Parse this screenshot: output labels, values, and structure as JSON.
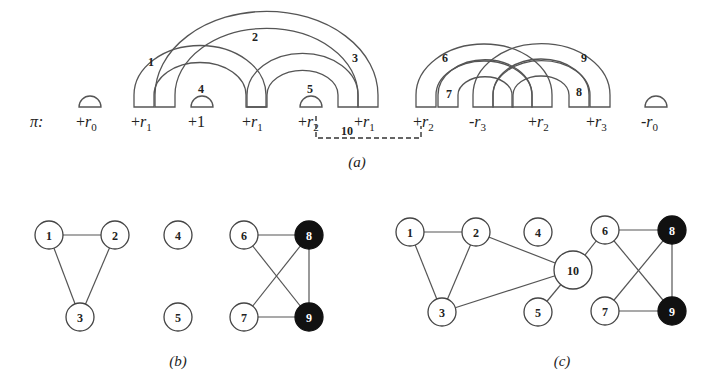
{
  "panel_a": {
    "pi_label": "π:",
    "caption": "(a)",
    "elements": [
      {
        "sign": "+",
        "sym": "r",
        "sub": "0",
        "x": 90
      },
      {
        "sign": "+",
        "sym": "r",
        "sub": "1",
        "x": 145
      },
      {
        "sign": "+",
        "sym": "1",
        "sub": "",
        "x": 202
      },
      {
        "sign": "+",
        "sym": "r",
        "sub": "1",
        "x": 256
      },
      {
        "sign": "+",
        "sym": "r",
        "sub": "2",
        "x": 312
      },
      {
        "sign": "+",
        "sym": "r",
        "sub": "1",
        "x": 368
      },
      {
        "sign": "+",
        "sym": "r",
        "sub": "2",
        "x": 427
      },
      {
        "sign": "-",
        "sym": "r",
        "sub": "3",
        "x": 483
      },
      {
        "sign": "+",
        "sym": "r",
        "sub": "2",
        "x": 542
      },
      {
        "sign": "+",
        "sym": "r",
        "sub": "3",
        "x": 600
      },
      {
        "sign": "-",
        "sym": "r",
        "sub": "0",
        "x": 655
      }
    ],
    "arcs": [
      {
        "label": "1",
        "x1": 134,
        "x2": 266,
        "lx": 148,
        "ly": 66
      },
      {
        "label": "2",
        "x1": 155,
        "x2": 378,
        "lx": 252,
        "ly": 41
      },
      {
        "label": "3",
        "x1": 247,
        "x2": 358,
        "lx": 352,
        "ly": 62
      },
      {
        "label": "6",
        "x1": 416,
        "x2": 552,
        "lx": 442,
        "ly": 62
      },
      {
        "label": "7",
        "x1": 438,
        "x2": 532,
        "lx": 446,
        "ly": 98
      },
      {
        "label": "8",
        "x1": 493,
        "x2": 589,
        "lx": 576,
        "ly": 96
      },
      {
        "label": "9",
        "x1": 473,
        "x2": 610,
        "lx": 581,
        "ly": 62
      }
    ],
    "domes": [
      {
        "label": "",
        "x": 90
      },
      {
        "label": "4",
        "x": 202
      },
      {
        "label": "5",
        "x": 311
      },
      {
        "label": "",
        "x": 656
      }
    ],
    "dashed_edge": {
      "label": "10"
    }
  },
  "panel_b": {
    "caption": "(b)",
    "nodes": [
      {
        "id": "1",
        "x": 49,
        "y": 235,
        "black": false
      },
      {
        "id": "2",
        "x": 115,
        "y": 235,
        "black": false
      },
      {
        "id": "3",
        "x": 80,
        "y": 317,
        "black": false
      },
      {
        "id": "4",
        "x": 178,
        "y": 235,
        "black": false
      },
      {
        "id": "5",
        "x": 178,
        "y": 317,
        "black": false
      },
      {
        "id": "6",
        "x": 244,
        "y": 235,
        "black": false
      },
      {
        "id": "7",
        "x": 244,
        "y": 317,
        "black": false
      },
      {
        "id": "8",
        "x": 309,
        "y": 235,
        "black": true
      },
      {
        "id": "9",
        "x": 309,
        "y": 317,
        "black": true
      }
    ],
    "edges": [
      [
        "1",
        "2"
      ],
      [
        "1",
        "3"
      ],
      [
        "2",
        "3"
      ],
      [
        "6",
        "8"
      ],
      [
        "6",
        "9"
      ],
      [
        "7",
        "8"
      ],
      [
        "7",
        "9"
      ],
      [
        "8",
        "9"
      ]
    ]
  },
  "panel_c": {
    "caption": "(c)",
    "nodes": [
      {
        "id": "1",
        "x": 410,
        "y": 232,
        "black": false
      },
      {
        "id": "2",
        "x": 476,
        "y": 232,
        "black": false
      },
      {
        "id": "3",
        "x": 442,
        "y": 312,
        "black": false
      },
      {
        "id": "4",
        "x": 538,
        "y": 232,
        "black": false
      },
      {
        "id": "5",
        "x": 538,
        "y": 312,
        "black": false
      },
      {
        "id": "10",
        "x": 573,
        "y": 270,
        "black": false,
        "r": 19
      },
      {
        "id": "6",
        "x": 605,
        "y": 230,
        "black": false
      },
      {
        "id": "7",
        "x": 605,
        "y": 311,
        "black": false
      },
      {
        "id": "8",
        "x": 672,
        "y": 230,
        "black": true
      },
      {
        "id": "9",
        "x": 672,
        "y": 311,
        "black": true
      }
    ],
    "edges": [
      [
        "1",
        "2"
      ],
      [
        "1",
        "3"
      ],
      [
        "2",
        "3"
      ],
      [
        "2",
        "10"
      ],
      [
        "3",
        "10"
      ],
      [
        "5",
        "10"
      ],
      [
        "6",
        "10"
      ],
      [
        "6",
        "8"
      ],
      [
        "6",
        "9"
      ],
      [
        "7",
        "8"
      ],
      [
        "7",
        "9"
      ],
      [
        "8",
        "9"
      ]
    ]
  }
}
